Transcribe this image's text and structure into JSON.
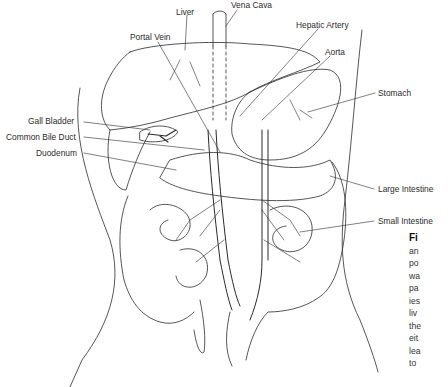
{
  "labels": {
    "liver": "Liver",
    "vena_cava": "Vena Cava",
    "portal_vein": "Portal Vein",
    "hepatic_artery": "Hepatic Artery",
    "aorta": "Aorta",
    "stomach": "Stomach",
    "gall_bladder": "Gall Bladder",
    "common_bile_duct": "Common Bile Duct",
    "duodenum": "Duodenum",
    "large_intestine": "Large Intestine",
    "small_intestine": "Small Intestine"
  },
  "caption": {
    "fig_label": "Fi",
    "lines": [
      "an",
      "po",
      "wa",
      "pa",
      "ies",
      "liv",
      "the",
      "eit",
      "lea",
      "to"
    ]
  },
  "colors": {
    "ink": "#2b2b2b",
    "background": "#ffffff"
  }
}
